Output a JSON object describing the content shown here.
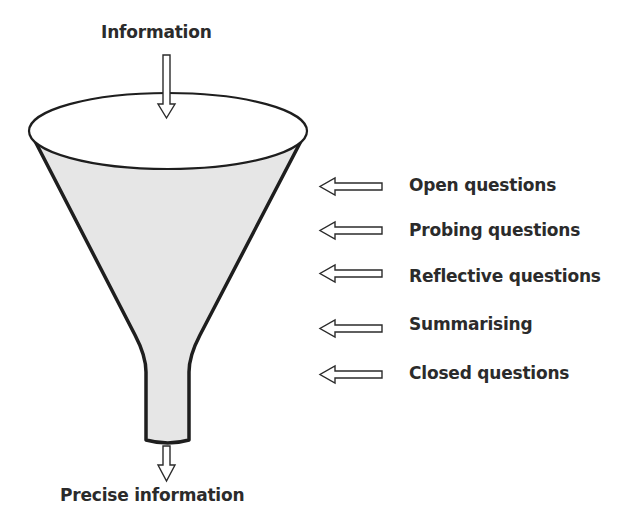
{
  "diagram": {
    "input_label": "Information",
    "output_label": "Precise information",
    "stages": [
      {
        "label": "Open questions",
        "y": 186
      },
      {
        "label": "Probing questions",
        "y": 231
      },
      {
        "label": "Reflective questions",
        "y": 277
      },
      {
        "label": "Summarising",
        "y": 325
      },
      {
        "label": "Closed questions",
        "y": 374
      }
    ],
    "colors": {
      "outline": "#1e1e1e",
      "funnel_fill": "#e6e6e6",
      "text": "#2b2b2b",
      "background": "#ffffff"
    }
  }
}
